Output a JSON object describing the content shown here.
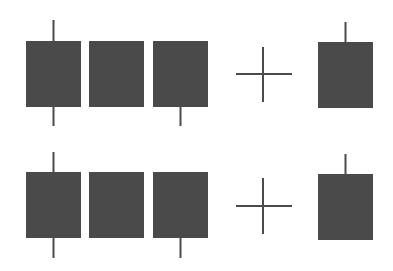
{
  "diagram": {
    "colors": {
      "background": "#ffffff",
      "candle_body": "#4a4a4a",
      "wick": "#4a4a4a",
      "operator": "#4a4a4a"
    },
    "rows": [
      {
        "name": "row-top",
        "candles": [
          {
            "name": "candle-1",
            "upper_wick": true,
            "lower_wick": true
          },
          {
            "name": "candle-2",
            "upper_wick": false,
            "lower_wick": false
          },
          {
            "name": "candle-3",
            "upper_wick": false,
            "lower_wick": true
          }
        ],
        "operator": "plus",
        "result": {
          "name": "result-candle",
          "upper_wick": true,
          "lower_wick": false
        }
      },
      {
        "name": "row-bottom",
        "candles": [
          {
            "name": "candle-1",
            "upper_wick": true,
            "lower_wick": true
          },
          {
            "name": "candle-2",
            "upper_wick": false,
            "lower_wick": false
          },
          {
            "name": "candle-3",
            "upper_wick": false,
            "lower_wick": true
          }
        ],
        "operator": "plus",
        "result": {
          "name": "result-candle",
          "upper_wick": true,
          "lower_wick": false
        }
      }
    ]
  }
}
